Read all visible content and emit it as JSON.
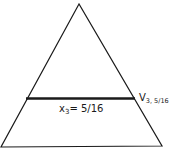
{
  "diagram": {
    "shape": "triangle",
    "apex": [
      79,
      4
    ],
    "base_left": [
      1,
      147
    ],
    "base_right": [
      162,
      146
    ],
    "stroke_color": "#1a1a1a",
    "cross_line": {
      "y": 98,
      "x_start": 26,
      "x_end": 135,
      "label_var": "x",
      "label_sub": "3",
      "label_eq": "= 5/16"
    },
    "vertex_label": {
      "main": "V",
      "sub": "3, 5/16"
    }
  }
}
